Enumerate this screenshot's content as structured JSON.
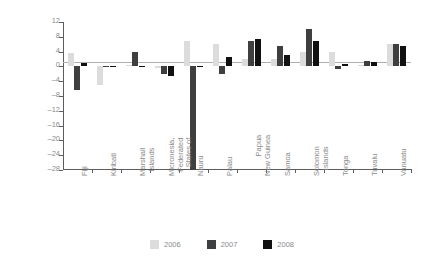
{
  "chart_data": {
    "type": "bar",
    "title": "",
    "xlabel": "",
    "ylabel": "Growth (per cent)",
    "ylim": [
      -28,
      12
    ],
    "yticks": [
      12,
      8,
      4,
      0,
      -4,
      -8,
      -12,
      -16,
      -20,
      -24,
      -28
    ],
    "ytick_labels": [
      "12",
      "8",
      "4",
      "0",
      "–4",
      "–8",
      "–12",
      "–16",
      "–20",
      "–24",
      "–28"
    ],
    "grid": false,
    "legend_position": "bottom-center",
    "categories": [
      "Fiji",
      "Kiribati",
      "Marshall Islands",
      "Micronesia, Federated States of",
      "Nauru",
      "Palau",
      "Papua New Guinea",
      "Samoa",
      "Solomon Islands",
      "Tonga",
      "Tuvalu",
      "Vanuatu"
    ],
    "category_lines": [
      [
        "Fiji"
      ],
      [
        "Kiribati"
      ],
      [
        "Marshall",
        "Islands"
      ],
      [
        "Micronesia,",
        "Federated",
        "States of"
      ],
      [
        "Nauru"
      ],
      [
        "Palau"
      ],
      [
        "Papua",
        "New Guinea"
      ],
      [
        "Samoa"
      ],
      [
        "Solomon",
        "Islands"
      ],
      [
        "Tonga"
      ],
      [
        "Tuvalu"
      ],
      [
        "Vanuatu"
      ]
    ],
    "series": [
      {
        "name": "2006",
        "color": "#dcdcdc",
        "values": [
          3.5,
          -5.0,
          0.5,
          -0.5,
          7.0,
          6.0,
          2.0,
          2.0,
          4.0,
          4.0,
          0.5,
          6.0
        ]
      },
      {
        "name": "2007",
        "color": "#3f3f3f",
        "values": [
          -6.5,
          0.2,
          3.8,
          -2.0,
          -28.0,
          -2.0,
          7.0,
          5.5,
          10.0,
          -0.6,
          1.5,
          6.0
        ]
      },
      {
        "name": "2008",
        "color": "#111111",
        "values": [
          1.0,
          0.2,
          0.2,
          -2.5,
          0.2,
          2.5,
          7.5,
          3.0,
          7.0,
          0.6,
          1.2,
          5.5
        ]
      }
    ]
  },
  "legend": {
    "items": [
      {
        "label": "2006",
        "color": "#dcdcdc"
      },
      {
        "label": "2007",
        "color": "#3f3f3f"
      },
      {
        "label": "2008",
        "color": "#111111"
      }
    ]
  }
}
